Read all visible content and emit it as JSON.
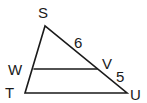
{
  "diagram": {
    "type": "triangle-with-parallel-segment",
    "points": {
      "S": {
        "label": "S"
      },
      "T": {
        "label": "T"
      },
      "U": {
        "label": "U"
      },
      "W": {
        "label": "W"
      },
      "V": {
        "label": "V"
      }
    },
    "segments": [
      "ST",
      "SU",
      "TU",
      "WV"
    ],
    "measurements": {
      "SV": "6",
      "VU": "5"
    },
    "colors": {
      "stroke": "#1a1a1a",
      "background": "#ffffff"
    }
  }
}
